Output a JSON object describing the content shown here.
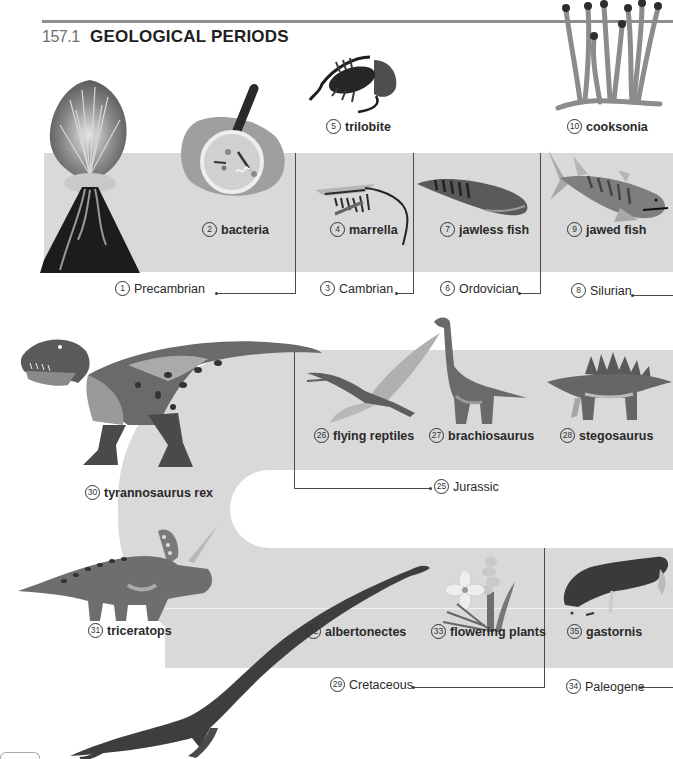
{
  "header": {
    "section_number": "157.1",
    "title": "GEOLOGICAL PERIODS"
  },
  "colors": {
    "band": "#d9d9d9",
    "rule": "#8e8e8e",
    "text": "#2a2a2a"
  },
  "periods": [
    {
      "num": "1",
      "label": "Precambrian"
    },
    {
      "num": "3",
      "label": "Cambrian"
    },
    {
      "num": "6",
      "label": "Ordovician"
    },
    {
      "num": "8",
      "label": "Silurian"
    },
    {
      "num": "25",
      "label": "Jurassic"
    },
    {
      "num": "29",
      "label": "Cretaceous"
    },
    {
      "num": "34",
      "label": "Paleogene"
    }
  ],
  "items": [
    {
      "num": "2",
      "label": "bacteria",
      "icon": "bacteria-petri-dish-icon"
    },
    {
      "num": "4",
      "label": "marrella",
      "icon": "marrella-icon"
    },
    {
      "num": "5",
      "label": "trilobite",
      "icon": "trilobite-icon"
    },
    {
      "num": "7",
      "label": "jawless fish",
      "icon": "jawless-fish-icon"
    },
    {
      "num": "9",
      "label": "jawed fish",
      "icon": "jawed-fish-icon"
    },
    {
      "num": "10",
      "label": "cooksonia",
      "icon": "cooksonia-plant-icon"
    },
    {
      "num": "26",
      "label": "flying reptiles",
      "icon": "pterosaur-icon"
    },
    {
      "num": "27",
      "label": "brachiosaurus",
      "icon": "brachiosaurus-icon"
    },
    {
      "num": "28",
      "label": "stegosaurus",
      "icon": "stegosaurus-icon"
    },
    {
      "num": "30",
      "label": "tyrannosaurus rex",
      "icon": "tyrannosaurus-icon"
    },
    {
      "num": "31",
      "label": "triceratops",
      "icon": "triceratops-icon"
    },
    {
      "num": "32",
      "label": "albertonectes",
      "icon": "albertonectes-icon"
    },
    {
      "num": "33",
      "label": "flowering plants",
      "icon": "flowering-plants-icon"
    },
    {
      "num": "35",
      "label": "gastornis",
      "icon": "gastornis-icon"
    }
  ]
}
